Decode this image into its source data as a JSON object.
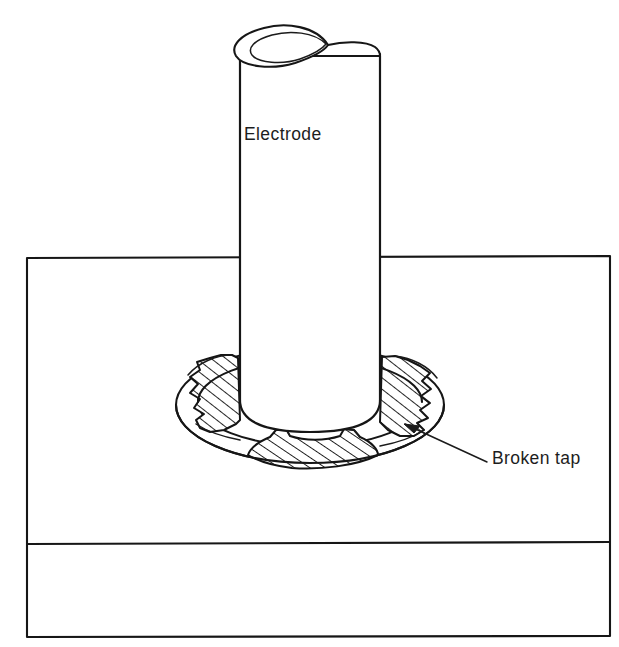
{
  "figure": {
    "domain": "engineering-diagram",
    "width": 619,
    "height": 647,
    "background_color": "#ffffff",
    "ink_color": "#161616"
  },
  "labels": {
    "electrode": "Electrode",
    "broken_tap": "Broken tap"
  },
  "parts": {
    "electrode": {
      "name": "Electrode",
      "shape": "cylinder",
      "left_x": 240,
      "right_x": 380,
      "top_y": 40,
      "bottom_y": 428,
      "top_opening": "pointed-oval double outline"
    },
    "workpiece": {
      "name": "Workpiece block",
      "shape": "rectangle",
      "left_x": 27,
      "right_x": 610,
      "top_y": 257,
      "bottom_y": 637,
      "divider_y": 544
    },
    "hole": {
      "name": "Tapped hole",
      "shape": "ellipse-annulus",
      "center_x": 310,
      "center_y": 405,
      "outer_rx": 134,
      "outer_ry": 58,
      "inner_rx": 112,
      "inner_ry": 44
    },
    "tap_fragments": [
      {
        "id": "fragment-left",
        "position": "left",
        "hatched": true,
        "fracture_edge": "jagged"
      },
      {
        "id": "fragment-right",
        "position": "right",
        "hatched": true,
        "fracture_edge": "jagged"
      },
      {
        "id": "fragment-front",
        "position": "front-bottom",
        "hatched": true,
        "fracture_edge": "notched"
      }
    ]
  },
  "annotations": [
    {
      "id": "electrode-annotation",
      "text": "Electrode",
      "x": 244,
      "y": 124,
      "has_leader": false
    },
    {
      "id": "broken-tap-annotation",
      "text": "Broken tap",
      "x": 492,
      "y": 448,
      "has_leader": true,
      "leader_from_x": 487,
      "leader_from_y": 462,
      "leader_to_x": 412,
      "leader_to_y": 428
    }
  ]
}
